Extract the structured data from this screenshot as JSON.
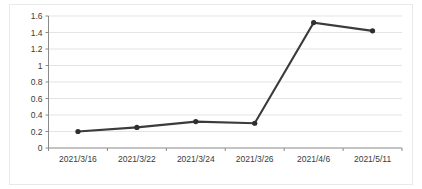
{
  "chart_data": {
    "type": "line",
    "title": "",
    "subtitle": "",
    "xlabel": "",
    "ylabel": "",
    "categories": [
      "2021/3/16",
      "2021/3/22",
      "2021/3/24",
      "2021/3/26",
      "2021/4/6",
      "2021/5/11"
    ],
    "values": [
      0.2,
      0.25,
      0.32,
      0.3,
      1.52,
      1.42
    ],
    "series": [
      {
        "name": "",
        "values": [
          0.2,
          0.25,
          0.32,
          0.3,
          1.52,
          1.42
        ]
      }
    ],
    "ylim": [
      0,
      1.6
    ],
    "ytick_labels": [
      "1.6",
      "1.4",
      "1.2",
      "1",
      "0.8",
      "0.6",
      "0.4",
      "0.2",
      "0"
    ],
    "ytick_values": [
      1.6,
      1.4,
      1.2,
      1.0,
      0.8,
      0.6,
      0.4,
      0.2,
      0
    ],
    "xtick_labels": [
      "2021/3/16",
      "2021/3/22",
      "2021/3/24",
      "2021/3/26",
      "2021/4/6",
      "2021/5/11"
    ],
    "grid": "horizontal",
    "legend": "none",
    "marker": "filled-circle",
    "line_color": "#3b3b3b",
    "marker_color": "#2f2f2f",
    "grid_color": "#d8d8d8",
    "axis_color": "#8a8a8a",
    "background_color": "#ffffff",
    "annotations": []
  }
}
